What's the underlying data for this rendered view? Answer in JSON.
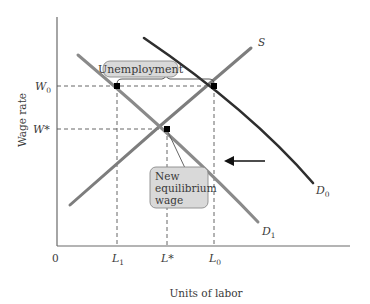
{
  "diagram": {
    "axes": {
      "x_label": "Units of labor",
      "y_label": "Wage rate",
      "origin_label": "0"
    },
    "y_ticks": [
      {
        "id": "W0",
        "main": "W",
        "sub": "0",
        "y": 86
      },
      {
        "id": "Wstar",
        "main": "W*",
        "sub": "",
        "y": 129
      }
    ],
    "x_ticks": [
      {
        "id": "L1",
        "main": "L",
        "sub": "1",
        "x": 117
      },
      {
        "id": "Lstar",
        "main": "L*",
        "sub": "",
        "x": 167
      },
      {
        "id": "L0",
        "main": "L",
        "sub": "0",
        "x": 214
      }
    ],
    "curves": {
      "supply": {
        "label": "S",
        "sub": ""
      },
      "demand_initial": {
        "label": "D",
        "sub": "0"
      },
      "demand_new": {
        "label": "D",
        "sub": "1"
      }
    },
    "points": [
      {
        "name": "W0-on-D1",
        "x": 117,
        "y": 86
      },
      {
        "name": "W0-on-S",
        "x": 214,
        "y": 86
      },
      {
        "name": "new-equilibrium",
        "x": 167,
        "y": 129
      }
    ],
    "callouts": {
      "unemployment": "Unemployment",
      "new_equilibrium": [
        "New",
        "equilibrium",
        "wage"
      ]
    },
    "shift_arrow": {
      "direction": "left"
    },
    "colors": {
      "supply": "#7d7d7d",
      "demand_new": "#8a8a8a",
      "demand_initial": "#2e2e2e",
      "callout_fill": "#d9d9d9"
    }
  }
}
